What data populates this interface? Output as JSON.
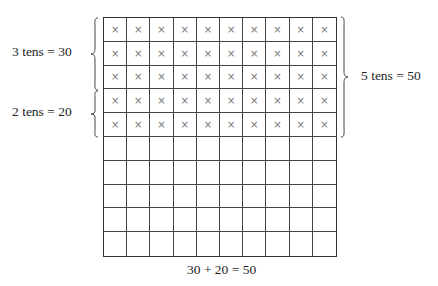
{
  "diagram": {
    "grid": {
      "rows": 10,
      "columns": 10,
      "marked_rows": 5,
      "mark_symbol": "×"
    },
    "labels": {
      "left_top": "3 tens = 30",
      "left_bottom": "2 tens = 20",
      "right": "5 tens = 50",
      "equation": "30 + 20 = 50"
    },
    "groups": [
      {
        "name": "3 tens",
        "rows": 3,
        "value": 30
      },
      {
        "name": "2 tens",
        "rows": 2,
        "value": 20
      },
      {
        "name": "5 tens",
        "rows": 5,
        "value": 50
      }
    ]
  }
}
